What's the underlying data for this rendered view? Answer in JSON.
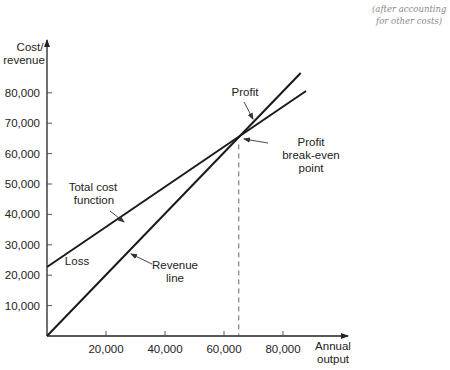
{
  "handwritten_note": [
    "(after accounting",
    "for other costs)"
  ],
  "chart_data": {
    "type": "line",
    "title": "",
    "ylabel": [
      "Cost/",
      "revenue"
    ],
    "xlabel": [
      "Annual",
      "output"
    ],
    "xlim": [
      0,
      100000
    ],
    "ylim": [
      0,
      100000
    ],
    "x_ticks": [
      20000,
      40000,
      60000,
      80000
    ],
    "x_tick_labels": [
      "20,000",
      "40,000",
      "60,000",
      "80,000"
    ],
    "y_ticks": [
      10000,
      20000,
      30000,
      40000,
      50000,
      60000,
      70000,
      80000
    ],
    "y_tick_labels": [
      "10,000",
      "20,000",
      "30,000",
      "40,000",
      "50,000",
      "60,000",
      "70,000",
      "80,000"
    ],
    "grid": false,
    "series": [
      {
        "name": "Revenue line",
        "points": [
          [
            0,
            0
          ],
          [
            86000,
            86500
          ]
        ]
      },
      {
        "name": "Total cost function",
        "points": [
          [
            0,
            22700
          ],
          [
            87800,
            80600
          ]
        ]
      }
    ],
    "break_even": {
      "x": 65000,
      "y": 65000
    },
    "annotations": {
      "profit": "Profit",
      "loss": "Loss",
      "break_even": [
        "Profit",
        "break-even",
        "point"
      ],
      "total_cost": [
        "Total cost",
        "function"
      ],
      "revenue": [
        "Revenue",
        "line"
      ]
    }
  }
}
